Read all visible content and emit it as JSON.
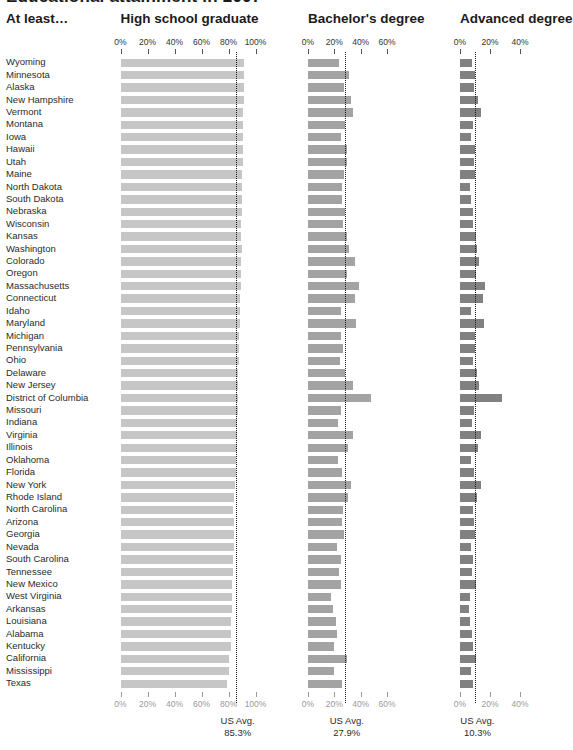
{
  "title": "Educational attainment in 2007",
  "row_header_label": "At least…",
  "columns": [
    {
      "key": "hs",
      "header": "High school graduate",
      "ticks": [
        "0%",
        "20%",
        "40%",
        "60%",
        "80%",
        "100%"
      ],
      "tick_values": [
        0,
        20,
        40,
        60,
        80,
        100
      ],
      "axis_max": 100,
      "us_avg_label": "US Avg.",
      "us_avg_value": "85.3%",
      "us_avg": 85.3,
      "bar_color": "#c6c6c6"
    },
    {
      "key": "ba",
      "header": "Bachelor's degree",
      "ticks": [
        "0%",
        "20%",
        "40%",
        "60%"
      ],
      "tick_values": [
        0,
        20,
        40,
        60
      ],
      "axis_max": 60,
      "us_avg_label": "US Avg.",
      "us_avg_value": "27.9%",
      "us_avg": 27.9,
      "bar_color": "#a3a3a3"
    },
    {
      "key": "adv",
      "header": "Advanced degree",
      "ticks": [
        "0%",
        "20%",
        "40%"
      ],
      "tick_values": [
        0,
        20,
        40
      ],
      "axis_max": 40,
      "us_avg_label": "US Avg.",
      "us_avg_value": "10.3%",
      "us_avg": 10.3,
      "bar_color": "#818181"
    }
  ],
  "chart_data": {
    "type": "bar",
    "title": "Educational attainment in 2007",
    "xlabel": "Percent of population age 25 and over",
    "ylabel": "At least…",
    "orientation": "horizontal",
    "grid": false,
    "legend": "none",
    "panels": [
      "High school graduate",
      "Bachelor's degree",
      "Advanced degree"
    ],
    "axis_ranges": {
      "High school graduate": [
        0,
        100
      ],
      "Bachelor's degree": [
        0,
        60
      ],
      "Advanced degree": [
        0,
        40
      ]
    },
    "reference_lines": {
      "High school graduate": 85.3,
      "Bachelor's degree": 27.9,
      "Advanced degree": 10.3
    },
    "categories": [
      "Wyoming",
      "Minnesota",
      "Alaska",
      "New Hampshire",
      "Vermont",
      "Montana",
      "Iowa",
      "Hawaii",
      "Utah",
      "Maine",
      "North Dakota",
      "South Dakota",
      "Nebraska",
      "Wisconsin",
      "Kansas",
      "Washington",
      "Colorado",
      "Oregon",
      "Massachusetts",
      "Connecticut",
      "Idaho",
      "Maryland",
      "Michigan",
      "Pennsylvania",
      "Ohio",
      "Delaware",
      "New Jersey",
      "District of Columbia",
      "Missouri",
      "Indiana",
      "Virginia",
      "Illinois",
      "Oklahoma",
      "Florida",
      "New York",
      "Rhode Island",
      "North Carolina",
      "Arizona",
      "Georgia",
      "Nevada",
      "South Carolina",
      "Tennessee",
      "New Mexico",
      "West Virginia",
      "Arkansas",
      "Louisiana",
      "Alabama",
      "Kentucky",
      "California",
      "Mississippi",
      "Texas"
    ],
    "series": [
      {
        "name": "High school graduate",
        "values": [
          91.8,
          91.5,
          91.4,
          91.3,
          90.8,
          90.8,
          90.5,
          90.4,
          90.4,
          90.2,
          90.1,
          89.9,
          89.8,
          89.4,
          89.2,
          89.7,
          89.3,
          89.1,
          88.9,
          88.6,
          88.4,
          88.2,
          88.0,
          87.9,
          87.6,
          87.4,
          87.4,
          87.1,
          86.8,
          86.6,
          86.6,
          86.4,
          85.6,
          85.3,
          84.7,
          84.2,
          83.6,
          84.2,
          83.9,
          83.9,
          83.6,
          83.1,
          82.8,
          82.8,
          82.4,
          81.6,
          82.1,
          81.7,
          80.6,
          80.4,
          79.1
        ]
      },
      {
        "name": "Bachelor's degree",
        "values": [
          23.4,
          31.5,
          27.3,
          32.5,
          34.2,
          28.4,
          25.1,
          29.6,
          29.3,
          27.2,
          26.0,
          25.9,
          28.1,
          26.3,
          29.7,
          31.4,
          35.9,
          29.5,
          38.7,
          35.6,
          24.7,
          36.1,
          25.3,
          26.9,
          24.6,
          27.8,
          34.5,
          47.5,
          25.3,
          23.0,
          34.0,
          30.6,
          22.8,
          26.0,
          32.5,
          30.5,
          26.5,
          25.9,
          27.5,
          22.2,
          24.9,
          23.6,
          25.3,
          17.3,
          19.3,
          21.4,
          22.0,
          20.0,
          29.7,
          19.6,
          25.5
        ]
      },
      {
        "name": "Advanced degree",
        "values": [
          8.0,
          10.3,
          9.4,
          11.8,
          13.7,
          8.9,
          7.3,
          9.9,
          9.0,
          9.9,
          6.6,
          7.2,
          8.9,
          8.8,
          10.4,
          11.1,
          12.7,
          10.8,
          16.4,
          15.5,
          7.5,
          16.0,
          9.7,
          10.0,
          8.8,
          11.4,
          12.9,
          27.9,
          9.3,
          8.1,
          13.8,
          11.7,
          7.2,
          9.0,
          14.0,
          11.6,
          8.8,
          9.3,
          9.9,
          7.2,
          8.4,
          7.8,
          10.8,
          6.5,
          6.1,
          6.5,
          7.7,
          8.5,
          10.7,
          7.0,
          8.5
        ]
      }
    ]
  }
}
